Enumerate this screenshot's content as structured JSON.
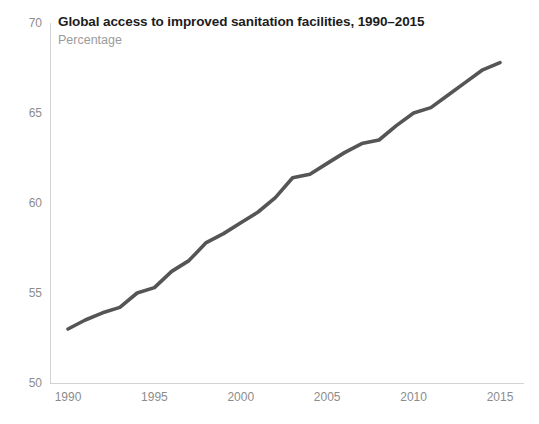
{
  "chart_data": {
    "type": "line",
    "title": "Global access to improved sanitation facilities, 1990–2015",
    "subtitle": "Percentage",
    "xlabel": "",
    "ylabel": "",
    "legend": null,
    "grid": false,
    "xlim": [
      1990,
      2015
    ],
    "ylim": [
      50,
      70
    ],
    "yticks": [
      50,
      55,
      60,
      65,
      70
    ],
    "ytick_labels": [
      "50",
      "55",
      "60",
      "65",
      "70"
    ],
    "xticks": [
      1990,
      1995,
      2000,
      2005,
      2010,
      2015
    ],
    "xtick_labels": [
      "1990",
      "1995",
      "2000",
      "2005",
      "2010",
      "2015"
    ],
    "line_color": "#555555",
    "line_width": 3.6,
    "x": [
      1990,
      1991,
      1992,
      1993,
      1994,
      1995,
      1996,
      1997,
      1998,
      1999,
      2000,
      2001,
      2002,
      2003,
      2004,
      2005,
      2006,
      2007,
      2008,
      2009,
      2010,
      2011,
      2012,
      2013,
      2014,
      2015
    ],
    "series": [
      {
        "name": "Global access to improved sanitation facilities",
        "values": [
          53.0,
          53.5,
          53.9,
          54.2,
          55.0,
          55.3,
          56.2,
          56.8,
          57.8,
          58.3,
          58.9,
          59.5,
          60.3,
          61.4,
          61.6,
          62.2,
          62.8,
          63.3,
          63.5,
          64.3,
          65.0,
          65.3,
          66.0,
          66.7,
          67.4,
          67.8
        ]
      }
    ]
  },
  "axes_geometry": {
    "plot_left": 50,
    "plot_right": 524,
    "plot_top": 23,
    "plot_bottom": 383,
    "x_1990_px": 68,
    "x_2015_px": 500,
    "y_per_unit_px": 18
  }
}
